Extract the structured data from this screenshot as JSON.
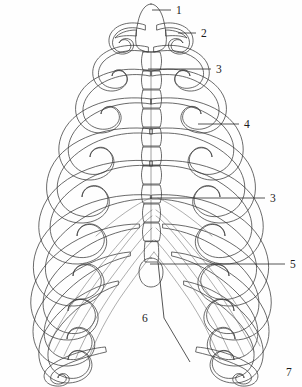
{
  "figure": {
    "background_color": "#fefefe",
    "line_color": "#3a3a3a",
    "label_color": "#1a1a1a",
    "shade_light": "#f4f4f4",
    "shade_mid": "#c9c9c9",
    "shade_dark": "#8e8e8e"
  },
  "labels": [
    {
      "id": "label-1",
      "text": "1",
      "tx": 176,
      "ty": 14,
      "line": [
        [
          152,
          10
        ],
        [
          171,
          10
        ]
      ]
    },
    {
      "id": "label-2",
      "text": "2",
      "tx": 201,
      "ty": 37,
      "line": [
        [
          178,
          33
        ],
        [
          196,
          33
        ]
      ]
    },
    {
      "id": "label-3-upper",
      "text": "3",
      "tx": 216,
      "ty": 73,
      "line": [
        [
          148,
          69
        ],
        [
          211,
          69
        ]
      ]
    },
    {
      "id": "label-4",
      "text": "4",
      "tx": 244,
      "ty": 128,
      "line": [
        [
          198,
          124
        ],
        [
          239,
          124
        ]
      ]
    },
    {
      "id": "label-3-lower",
      "text": "3",
      "tx": 270,
      "ty": 202,
      "line": [
        [
          150,
          198
        ],
        [
          265,
          198
        ]
      ]
    },
    {
      "id": "label-5",
      "text": "5",
      "tx": 290,
      "ty": 268,
      "line": [
        [
          150,
          264
        ],
        [
          285,
          264
        ]
      ]
    },
    {
      "id": "label-6",
      "text": "6",
      "tx": 142,
      "ty": 322,
      "line": [
        [
          158,
          262
        ],
        [
          164,
          318
        ],
        [
          190,
          362
        ]
      ]
    },
    {
      "id": "label-7",
      "text": "7",
      "tx": 286,
      "ty": 376,
      "line": [
        [
          286,
          376
        ],
        [
          286,
          376
        ]
      ]
    }
  ],
  "structure": {
    "rib_pairs": 12,
    "vertebra_segments": 12,
    "sides": [
      "left",
      "right"
    ],
    "center_column": "sternum-vertebral-column",
    "terminal_process": "xiphoid-process"
  },
  "watermark": {
    "text": ""
  }
}
